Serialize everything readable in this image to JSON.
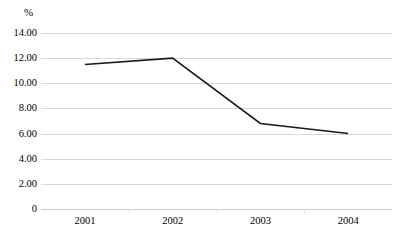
{
  "chart_data": {
    "type": "line",
    "title": "",
    "xlabel": "",
    "ylabel": "%",
    "categories": [
      "2001",
      "2002",
      "2003",
      "2004"
    ],
    "series": [
      {
        "name": "",
        "values": [
          11.5,
          12.0,
          6.8,
          6.0
        ]
      }
    ],
    "ylim": [
      0,
      14
    ],
    "ytick_labels": [
      "14.00",
      "12.00",
      "10.00",
      "8.00",
      "6.00",
      "4.00",
      "2.00",
      "0"
    ],
    "ytick_values": [
      14,
      12,
      10,
      8,
      6,
      4,
      2,
      0
    ],
    "grid": true,
    "legend": "none",
    "line_color": "#1a1a1a",
    "grid_color": "#d9d9d9",
    "background_color": "#ffffff"
  },
  "axis": {
    "unit_label": "%"
  }
}
